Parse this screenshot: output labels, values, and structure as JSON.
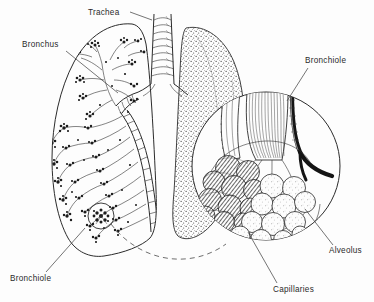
{
  "figure": {
    "style": "black and white line drawing with stipple shading",
    "background_color": "#fdfdfd",
    "ink_color": "#2b2b2b"
  },
  "labels": [
    {
      "id": "trachea",
      "text": "Trachea",
      "x": 88,
      "y": 15,
      "anchor": "start",
      "leader": "M 130 12 L 152 20",
      "points_to": "trachea-tube"
    },
    {
      "id": "bronchus",
      "text": "Bronchus",
      "x": 22,
      "y": 47,
      "anchor": "start",
      "leader": "M 66 51 L 118 93",
      "points_to": "main-bronchus"
    },
    {
      "id": "bronchiole-right",
      "text": "Bronchiole",
      "x": 305,
      "y": 63,
      "anchor": "start",
      "leader": "M 308 68 L 287 101",
      "points_to": "bronchiole-tube"
    },
    {
      "id": "alveolus",
      "text": "Alveolus",
      "x": 329,
      "y": 253,
      "anchor": "start",
      "leader": "M 333 245 L 305 209",
      "points_to": "alveolus-sac"
    },
    {
      "id": "capillaries",
      "text": "Capillaries",
      "x": 273,
      "y": 292,
      "anchor": "start",
      "leader": "M 277 283 L 248 232",
      "points_to": "capillary-network"
    },
    {
      "id": "bronchiole-left",
      "text": "Bronchiole",
      "x": 10,
      "y": 281,
      "anchor": "start",
      "leader": "M 46 272 L 85 228",
      "points_to": "bronchiole-callout-circle"
    }
  ],
  "structures": {
    "left_lung": {
      "name": "left lung with bronchial tree",
      "description": "outlined lung showing branching airway tree with dark terminal clusters"
    },
    "right_lung": {
      "name": "right lung",
      "description": "solid lung form rendered in stipple texture"
    },
    "trachea_rings": 7,
    "callout_circle": {
      "name": "magnified alveolar sac",
      "cx": 266,
      "cy": 166,
      "r": 74
    },
    "small_callout_circle": {
      "name": "bronchiole detail circle",
      "cx": 101,
      "cy": 216,
      "r": 13
    },
    "alveoli_count_plain": 12,
    "alveoli_count_capillary": 11
  }
}
